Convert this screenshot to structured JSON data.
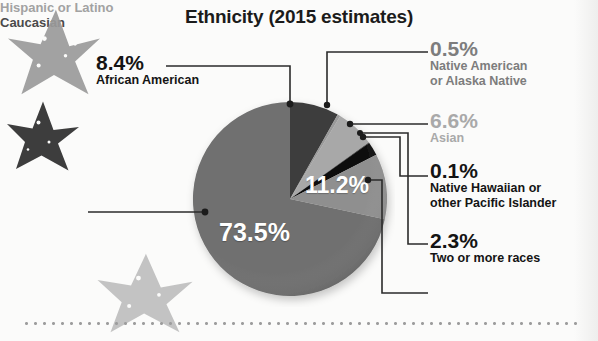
{
  "title": "Ethnicity (2015 estimates)",
  "chart_data": {
    "type": "pie",
    "title": "Ethnicity (2015 estimates)",
    "xlabel": "",
    "ylabel": "",
    "legend_position": "callouts",
    "unit": "percent",
    "categories": [
      "African American",
      "Native American or Alaska Native",
      "Asian",
      "Native Hawaiian or other Pacific Islander",
      "Two or more races",
      "Hispanic or Latino",
      "Caucasian"
    ],
    "values": [
      8.4,
      0.5,
      6.6,
      0.1,
      2.3,
      11.2,
      73.5
    ],
    "slice_colors": [
      "#3c3c3c",
      "#9a9a9a",
      "#a8a8a8",
      "#2a2a2a",
      "#101010",
      "#8f8f8f",
      "#6f6f6f"
    ],
    "start_angle_deg": 0,
    "direction": "clockwise"
  },
  "callouts": {
    "african_american": {
      "pct": "8.4%",
      "desc": "African American",
      "tone": "dark"
    },
    "native_american": {
      "pct": "0.5%",
      "desc_line1": "Native American",
      "desc_line2": "or Alaska Native",
      "tone": "mid"
    },
    "asian": {
      "pct": "6.6%",
      "desc": "Asian",
      "tone": "light"
    },
    "hawaiian": {
      "pct": "0.1%",
      "desc_line1": "Native Hawaiian or",
      "desc_line2": "other Pacific Islander",
      "tone": "dark"
    },
    "two_or_more": {
      "pct": "2.3%",
      "desc": "Two or more races",
      "tone": "dark"
    },
    "hispanic": {
      "label": "Hispanic or Latino",
      "tone": "light"
    },
    "caucasian": {
      "label": "Caucasian",
      "tone": "dark"
    }
  },
  "slice_labels": {
    "caucasian_pct": "73.5%",
    "hispanic_pct": "11.2%"
  },
  "colors": {
    "background": "#fbfbfa",
    "title": "#1b1b1b",
    "leader_line": "#2b2b2b",
    "dotted_rule": "#9d9d9d",
    "star_gray": "#9a9a9a",
    "star_dark": "#333333",
    "star_light": "#bdbdbd"
  }
}
